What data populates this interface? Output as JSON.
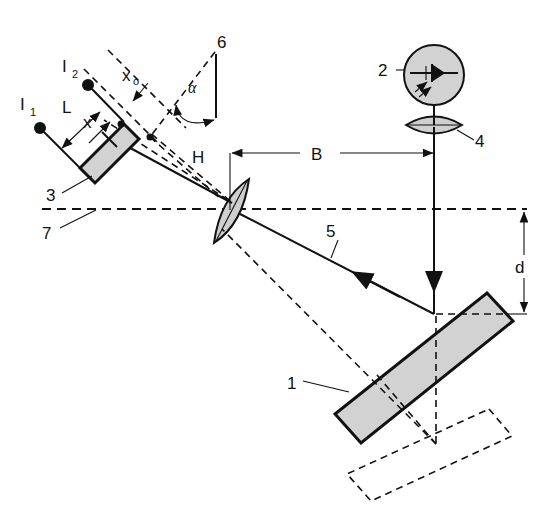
{
  "figure": {
    "background_color": "#ffffff",
    "line_color": "#111111",
    "body_fill_color": "#d2d2d2"
  },
  "labels": {
    "item_1": "1",
    "item_2": "2",
    "item_3": "3",
    "item_4": "4",
    "item_5": "5",
    "item_6": "6",
    "item_7": "7",
    "dim_L": "L",
    "dim_x": "x",
    "dim_x0_main": "x",
    "dim_x0_sub": "o",
    "dim_B": "B",
    "dim_d": "d",
    "dim_H": "H",
    "angle_alpha": "α",
    "source_I1_main": "I",
    "source_I1_sub": "1",
    "source_I2_main": "I",
    "source_I2_sub": "2"
  },
  "components": {
    "detector_array": {
      "name": "3",
      "description": "tilted shaded detector array"
    },
    "laser_diode": {
      "name": "2",
      "description": "laser diode symbol in circle"
    },
    "collimator_lens": {
      "name": "4",
      "description": "horizontal biconvex lens"
    },
    "imaging_lens": {
      "name": "H",
      "description": "tilted biconvex imaging lens"
    },
    "return_ray": {
      "name": "5",
      "description": "reflected measurement beam"
    },
    "optical_axis": {
      "name": "7",
      "description": "horizontal dashed reference axis"
    },
    "angle_ref": {
      "name": "6",
      "description": "angle reference construction"
    },
    "target_plate": {
      "name": "1",
      "description": "shaded tilted target plate"
    },
    "target_plate_shifted": {
      "name": "1-shifted",
      "description": "dashed displaced target plate"
    }
  },
  "dimensions": {
    "B": {
      "label": "B",
      "description": "horizontal distance from imaging lens to emission beam"
    },
    "d": {
      "label": "d",
      "description": "vertical distance from optical axis to target surface"
    },
    "L": {
      "label": "L",
      "description": "separation between image points I1 and I2"
    },
    "x": {
      "label": "x",
      "description": "offset on detector array"
    },
    "x0": {
      "label": "xo",
      "description": "reference offset on detector array"
    },
    "alpha": {
      "label": "α",
      "description": "triangulation angle"
    }
  }
}
